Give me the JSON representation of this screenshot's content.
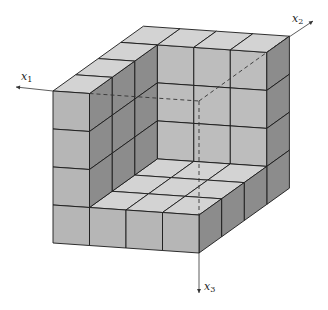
{
  "diagram": {
    "grid_size": 4,
    "projection": {
      "origin": [
        53,
        91
      ],
      "ex": [
        36.5,
        2.5
      ],
      "ey": [
        22.6,
        -16.2
      ],
      "ez": [
        0,
        38
      ]
    },
    "colors": {
      "top": "#d3d3d3",
      "front": "#b6b6b6",
      "back_inner": "#bdbdbd",
      "side_dark": "#8c8c8c",
      "stroke": "#1a1a1a",
      "axis": "#333333"
    },
    "structure": {
      "left_wall": "x=0 column, all depths, all 4 layers",
      "back_wall": "y=3 row, all widths, all 4 layers",
      "floor": "bottom layer (z=3), full 4x4"
    },
    "axes": [
      {
        "name": "x1",
        "label": "x",
        "sub": "1",
        "from": [
          53,
          91
        ],
        "to": [
          16,
          87
        ],
        "label_pos": [
          21,
          80
        ]
      },
      {
        "name": "x2",
        "label": "x",
        "sub": "2",
        "from": [
          289,
          37
        ],
        "to": [
          313,
          21
        ],
        "label_pos": [
          292,
          22
        ]
      },
      {
        "name": "x3",
        "label": "x",
        "sub": "3",
        "from": [
          199,
          253
        ],
        "to": [
          199,
          293
        ],
        "label_pos": [
          204,
          290
        ]
      }
    ]
  }
}
